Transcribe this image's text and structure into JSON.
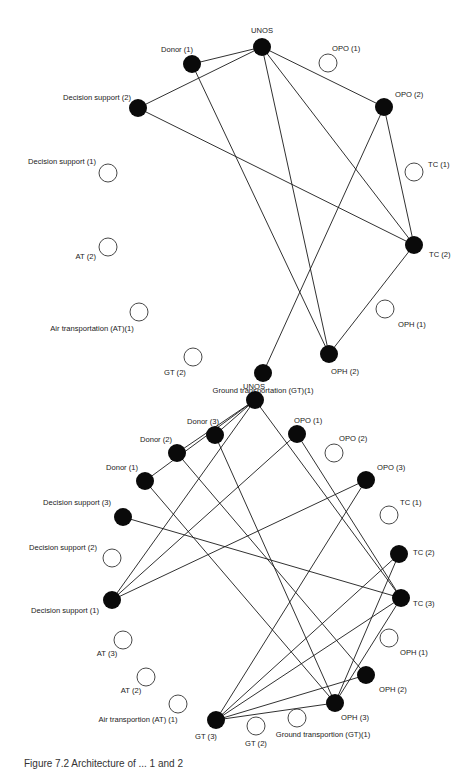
{
  "figure": {
    "caption": "Figure 7.2 Architecture of ... 1 and 2"
  },
  "graph_top": {
    "nodes": [
      {
        "id": "UNOS",
        "label": "UNOS",
        "x": 262,
        "y": 47,
        "filled": true,
        "lx": 262,
        "ly": 33,
        "anchor": "middle"
      },
      {
        "id": "DONOR1",
        "label": "Donor (1)",
        "x": 192,
        "y": 64,
        "filled": true,
        "lx": 177,
        "ly": 52,
        "anchor": "middle"
      },
      {
        "id": "OPO1",
        "label": "OPO (1)",
        "x": 328,
        "y": 63,
        "filled": false,
        "lx": 332,
        "ly": 51,
        "anchor": "start"
      },
      {
        "id": "DS2",
        "label": "Decision support (2)",
        "x": 138,
        "y": 108,
        "filled": true,
        "lx": 131,
        "ly": 100,
        "anchor": "end"
      },
      {
        "id": "OPO2",
        "label": "OPO (2)",
        "x": 384,
        "y": 107,
        "filled": true,
        "lx": 395,
        "ly": 97,
        "anchor": "start"
      },
      {
        "id": "DS1",
        "label": "Decision support (1)",
        "x": 108,
        "y": 173,
        "filled": false,
        "lx": 96,
        "ly": 164,
        "anchor": "end"
      },
      {
        "id": "TC1",
        "label": "TC (1)",
        "x": 414,
        "y": 172,
        "filled": false,
        "lx": 428,
        "ly": 167,
        "anchor": "start"
      },
      {
        "id": "AT2",
        "label": "AT (2)",
        "x": 108,
        "y": 247,
        "filled": false,
        "lx": 96,
        "ly": 259,
        "anchor": "end"
      },
      {
        "id": "TC2",
        "label": "TC (2)",
        "x": 414,
        "y": 245,
        "filled": true,
        "lx": 429,
        "ly": 257,
        "anchor": "start"
      },
      {
        "id": "AT1",
        "label": "Air transportation (AT)(1)",
        "x": 139,
        "y": 312,
        "filled": false,
        "lx": 92,
        "ly": 331,
        "anchor": "middle"
      },
      {
        "id": "OPH1",
        "label": "OPH (1)",
        "x": 385,
        "y": 309,
        "filled": false,
        "lx": 398,
        "ly": 327,
        "anchor": "start"
      },
      {
        "id": "GT2",
        "label": "GT (2)",
        "x": 193,
        "y": 357,
        "filled": false,
        "lx": 175,
        "ly": 375,
        "anchor": "middle"
      },
      {
        "id": "OPH2",
        "label": "OPH (2)",
        "x": 329,
        "y": 354,
        "filled": true,
        "lx": 345,
        "ly": 374,
        "anchor": "middle"
      },
      {
        "id": "GT1",
        "label": "Ground transportation (GT)(1)",
        "x": 263,
        "y": 373,
        "filled": true,
        "lx": 263,
        "ly": 393,
        "anchor": "middle"
      }
    ],
    "edges": [
      [
        "UNOS",
        "DONOR1"
      ],
      [
        "UNOS",
        "DS2"
      ],
      [
        "UNOS",
        "OPO2"
      ],
      [
        "UNOS",
        "OPH2"
      ],
      [
        "UNOS",
        "TC2"
      ],
      [
        "DONOR1",
        "OPH2"
      ],
      [
        "DS2",
        "TC2"
      ],
      [
        "OPO2",
        "TC2"
      ],
      [
        "OPO2",
        "GT1"
      ],
      [
        "TC2",
        "OPH2"
      ]
    ]
  },
  "graph_bottom": {
    "nodes": [
      {
        "id": "UNOS",
        "label": "UNOS",
        "x": 255,
        "y": 400,
        "filled": true,
        "lx": 254,
        "ly": 389,
        "anchor": "middle"
      },
      {
        "id": "DONOR3",
        "label": "Donor (3)",
        "x": 215,
        "y": 435,
        "filled": true,
        "lx": 203,
        "ly": 424,
        "anchor": "middle"
      },
      {
        "id": "OPO1",
        "label": "OPO (1)",
        "x": 297,
        "y": 434,
        "filled": true,
        "lx": 294,
        "ly": 423,
        "anchor": "start"
      },
      {
        "id": "DONOR2",
        "label": "Donor (2)",
        "x": 177,
        "y": 453,
        "filled": true,
        "lx": 156,
        "ly": 442,
        "anchor": "middle"
      },
      {
        "id": "OPO2",
        "label": "OPO (2)",
        "x": 334,
        "y": 453,
        "filled": false,
        "lx": 339,
        "ly": 441,
        "anchor": "start"
      },
      {
        "id": "DONOR1",
        "label": "Donor (1)",
        "x": 145,
        "y": 481,
        "filled": true,
        "lx": 122,
        "ly": 470,
        "anchor": "middle"
      },
      {
        "id": "OPO3",
        "label": "OPO (3)",
        "x": 366,
        "y": 480,
        "filled": true,
        "lx": 377,
        "ly": 470,
        "anchor": "start"
      },
      {
        "id": "DS3",
        "label": "Decision support (3)",
        "x": 123,
        "y": 517,
        "filled": true,
        "lx": 111,
        "ly": 505,
        "anchor": "end"
      },
      {
        "id": "TC1",
        "label": "TC (1)",
        "x": 389,
        "y": 515,
        "filled": false,
        "lx": 400,
        "ly": 505,
        "anchor": "start"
      },
      {
        "id": "DS2",
        "label": "Decision support (2)",
        "x": 112,
        "y": 558,
        "filled": false,
        "lx": 97,
        "ly": 550,
        "anchor": "end"
      },
      {
        "id": "TC2",
        "label": "TC (2)",
        "x": 399,
        "y": 554,
        "filled": true,
        "lx": 413,
        "ly": 555,
        "anchor": "start"
      },
      {
        "id": "DS1",
        "label": "Decision support (1)",
        "x": 112,
        "y": 600,
        "filled": true,
        "lx": 99,
        "ly": 613,
        "anchor": "end"
      },
      {
        "id": "TC3",
        "label": "TC (3)",
        "x": 401,
        "y": 598,
        "filled": true,
        "lx": 413,
        "ly": 606,
        "anchor": "start"
      },
      {
        "id": "AT3",
        "label": "AT (3)",
        "x": 123,
        "y": 640,
        "filled": false,
        "lx": 107,
        "ly": 656,
        "anchor": "middle"
      },
      {
        "id": "OPH1",
        "label": "OPH (1)",
        "x": 389,
        "y": 638,
        "filled": false,
        "lx": 400,
        "ly": 655,
        "anchor": "start"
      },
      {
        "id": "AT2",
        "label": "AT (2)",
        "x": 146,
        "y": 677,
        "filled": false,
        "lx": 131,
        "ly": 693,
        "anchor": "middle"
      },
      {
        "id": "OPH2",
        "label": "OPH (2)",
        "x": 366,
        "y": 675,
        "filled": true,
        "lx": 379,
        "ly": 692,
        "anchor": "start"
      },
      {
        "id": "AT1",
        "label": "Air transportion (AT) (1)",
        "x": 178,
        "y": 704,
        "filled": false,
        "lx": 138,
        "ly": 722,
        "anchor": "middle"
      },
      {
        "id": "OPH3",
        "label": "OPH (3)",
        "x": 335,
        "y": 703,
        "filled": true,
        "lx": 355,
        "ly": 720,
        "anchor": "middle"
      },
      {
        "id": "GT3",
        "label": "GT (3)",
        "x": 216,
        "y": 720,
        "filled": true,
        "lx": 206,
        "ly": 739,
        "anchor": "middle"
      },
      {
        "id": "GT2",
        "label": "GT (2)",
        "x": 256,
        "y": 726,
        "filled": false,
        "lx": 256,
        "ly": 746,
        "anchor": "middle"
      },
      {
        "id": "GT1",
        "label": "Ground transportion (GT)(1)",
        "x": 297,
        "y": 718,
        "filled": false,
        "lx": 323,
        "ly": 737,
        "anchor": "middle"
      }
    ],
    "edges": [
      [
        "UNOS",
        "DONOR3"
      ],
      [
        "UNOS",
        "DONOR2"
      ],
      [
        "UNOS",
        "DONOR1"
      ],
      [
        "UNOS",
        "DS1"
      ],
      [
        "UNOS",
        "TC3"
      ],
      [
        "DONOR3",
        "OPH3"
      ],
      [
        "DONOR2",
        "OPH2"
      ],
      [
        "DONOR1",
        "OPH3"
      ],
      [
        "OPO1",
        "DS1"
      ],
      [
        "OPO1",
        "TC3"
      ],
      [
        "OPO3",
        "DS1"
      ],
      [
        "OPO3",
        "GT3"
      ],
      [
        "DS3",
        "TC3"
      ],
      [
        "TC2",
        "GT3"
      ],
      [
        "TC2",
        "OPH3"
      ],
      [
        "TC3",
        "GT3"
      ],
      [
        "TC3",
        "OPH3"
      ],
      [
        "OPH2",
        "GT3"
      ],
      [
        "OPH3",
        "GT3"
      ]
    ]
  }
}
